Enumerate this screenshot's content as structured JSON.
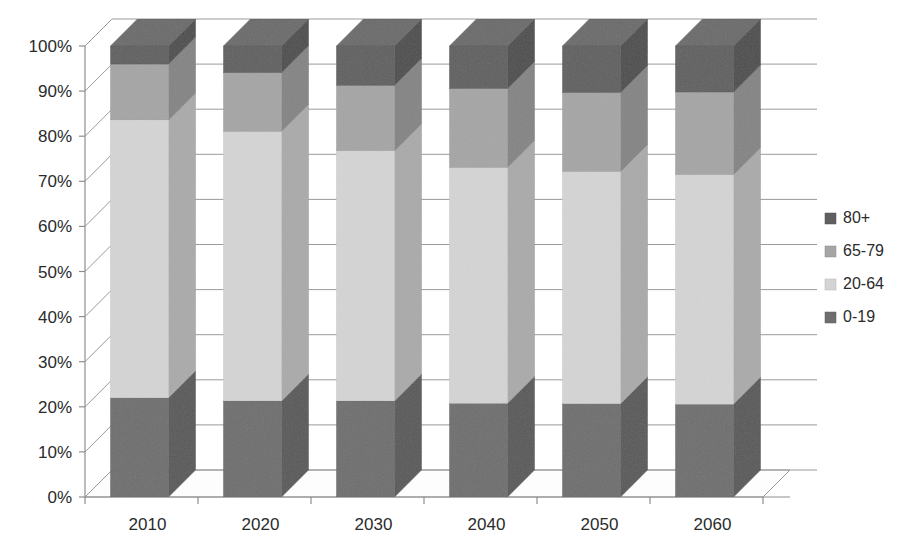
{
  "chart_data": {
    "type": "bar",
    "subtype": "stacked-100-percent-3d",
    "title": "",
    "xlabel": "",
    "ylabel": "",
    "categories": [
      "2010",
      "2020",
      "2030",
      "2040",
      "2050",
      "2060"
    ],
    "ylim": [
      0,
      100
    ],
    "ytick_labels": [
      "0%",
      "10%",
      "20%",
      "30%",
      "40%",
      "50%",
      "60%",
      "70%",
      "80%",
      "90%",
      "100%"
    ],
    "ytick_values": [
      0,
      10,
      20,
      30,
      40,
      50,
      60,
      70,
      80,
      90,
      100
    ],
    "grid": true,
    "legend_position": "right",
    "stack_order_bottom_to_top": [
      "0-19",
      "20-64",
      "65-79",
      "80+"
    ],
    "series": [
      {
        "name": "0-19",
        "color": "#6e6e6e",
        "values": [
          22.0,
          21.3,
          21.3,
          20.8,
          20.7,
          20.6
        ]
      },
      {
        "name": "20-64",
        "color": "#d4d4d4",
        "values": [
          61.6,
          59.8,
          55.5,
          52.3,
          51.5,
          50.9
        ]
      },
      {
        "name": "65-79",
        "color": "#a5a5a5",
        "values": [
          12.4,
          13.0,
          14.5,
          17.5,
          17.5,
          18.3
        ]
      },
      {
        "name": "80+",
        "color": "#5f5f5f",
        "values": [
          4.0,
          5.9,
          8.7,
          9.4,
          10.3,
          10.2
        ]
      }
    ],
    "legend_entries": [
      {
        "label": "80+",
        "color": "#5f5f5f"
      },
      {
        "label": "65-79",
        "color": "#a5a5a5"
      },
      {
        "label": "20-64",
        "color": "#d4d4d4"
      },
      {
        "label": "0-19",
        "color": "#6e6e6e"
      }
    ]
  },
  "colors": {
    "background": "#ffffff",
    "gridline": "#9a9a9a",
    "axis": "#8e8e8e",
    "text": "#2b2b2b",
    "floor": "#fdfdfd"
  }
}
